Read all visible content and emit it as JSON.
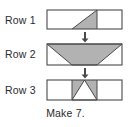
{
  "diagram": {
    "title_caption": "Make 7.",
    "colors": {
      "shaded": "#b2b2b2",
      "unshaded": "#ffffff",
      "outline": "#4a4a4a",
      "text": "#2b2b2b",
      "arrow": "#4a4a4a"
    },
    "rows": [
      {
        "label": "Row 1",
        "cells": 3,
        "description": "three-cell strip; middle cell contains one shaded right triangle with hypotenuse from bottom-left to top-right, shaded on the lower-right side; outer cells are blank white squares",
        "shaded_cell_index": 1,
        "shape": "right-triangle"
      },
      {
        "label": "Row 2",
        "cells": 3,
        "description": "three-cell strip forming one shaded trapezoid spanning the full top edge and narrowing to the middle cell at the bottom; white right triangles fill the bottom-left and bottom-right corners",
        "shaded_cell_index": "all",
        "shape": "trapezoid"
      },
      {
        "label": "Row 3",
        "cells": 3,
        "description": "three-cell strip; middle cell is shaded with a white upward-pointing triangle cut from it, leaving two shaded triangles at the lower left and lower right; outer cells are blank white squares",
        "shaded_cell_index": 1,
        "shape": "inverted-notch"
      }
    ],
    "arrows": [
      {
        "name": "arrow-row1-to-row2",
        "direction": "down"
      },
      {
        "name": "arrow-row2-to-row3",
        "direction": "down"
      }
    ]
  }
}
